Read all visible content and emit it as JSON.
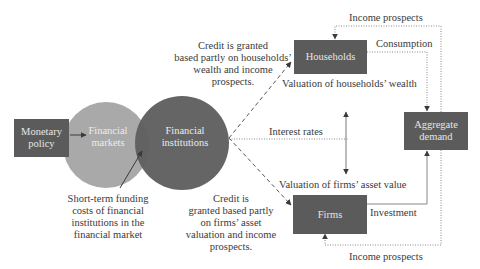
{
  "diagram": {
    "nodes": {
      "monetary_policy": "Monetary\npolicy",
      "financial_markets": "Financial\nmarkets",
      "financial_institutions": "Financial\ninstitutions",
      "households": "Households",
      "firms": "Firms",
      "aggregate_demand": "Aggregate\ndemand"
    },
    "labels": {
      "credit_households": "Credit is granted\nbased partly on households’\nwealth and income\nprospects.",
      "credit_firms": "Credit is\ngranted based partly\non firms’ asset\nvaluation and income\nprospects.",
      "short_term_funding": "Short-term funding\ncosts of financial\ninstitutions in the\nfinancial market",
      "interest_rates": "Interest rates",
      "valuation_households": "Valuation of households’ wealth",
      "valuation_firms": "Valuation of firms’ asset value",
      "income_prospects_top": "Income prospects",
      "income_prospects_bottom": "Income prospects",
      "consumption": "Consumption",
      "investment": "Investment"
    },
    "colors": {
      "box_fill": "#5b5b5b",
      "circle_markets": "#a9a9a9",
      "circle_institutions": "#5f5f5f",
      "line": "#6a6a6a",
      "text": "#3a3a3a"
    }
  }
}
